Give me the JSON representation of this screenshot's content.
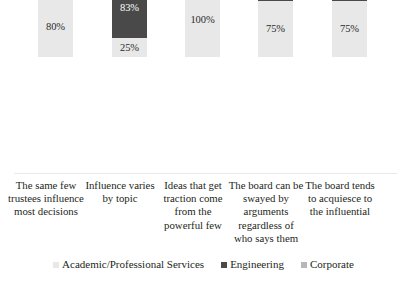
{
  "chart_data": {
    "type": "bar",
    "subtype": "stacked-bar",
    "title": "",
    "subtitle": "",
    "xlabel": "",
    "ylabel": "",
    "grid": false,
    "legend_position": "bottom",
    "axis_visible": false,
    "ylim": [
      0,
      202
    ],
    "categories": [
      "The same few trustees influence most decisions",
      "Influence varies by topic",
      "Ideas that get traction come from the powerful few",
      "The board can be swayed by arguments regardless of who says them",
      "The board tends to acquiesce to the influential"
    ],
    "series": [
      {
        "name": "Academic/Professional Services",
        "color": "#e8e8e8",
        "values": [
          80,
          25,
          100,
          75,
          75
        ],
        "labels": [
          "80%",
          "25%",
          "100%",
          "75%",
          "75%"
        ]
      },
      {
        "name": "Engineering",
        "color": "#494949",
        "values": [
          33,
          83,
          33,
          33,
          17
        ],
        "labels": [
          "33%",
          "83%",
          "33%",
          "33%",
          "17%"
        ]
      },
      {
        "name": "Corporate",
        "color": "#b7b7b7",
        "values": [
          43,
          86,
          29,
          71,
          29
        ],
        "labels": [
          "43%",
          "86%",
          "29%",
          "71%",
          "29%"
        ]
      }
    ]
  },
  "legend": {
    "items": [
      {
        "label": "Academic/Professional Services",
        "color": "#e8e8e8",
        "icon": "square-swatch-icon"
      },
      {
        "label": "Engineering",
        "color": "#494949",
        "icon": "square-swatch-icon"
      },
      {
        "label": "Corporate",
        "color": "#b7b7b7",
        "icon": "square-swatch-icon"
      }
    ]
  },
  "bars": [
    {
      "category": "The same few trustees influence most decisions",
      "x": 38,
      "label_x": 8,
      "segments": [
        {
          "series": "Academic/Professional Services",
          "value": 80,
          "label": "80%",
          "class": "seg-academic"
        },
        {
          "series": "Engineering",
          "value": 33,
          "label": "33%",
          "class": "seg-engineering"
        },
        {
          "series": "Corporate",
          "value": 43,
          "label": "43%",
          "class": "seg-corporate"
        }
      ]
    },
    {
      "category": "Influence varies by topic",
      "x": 112,
      "label_x": 82,
      "segments": [
        {
          "series": "Academic/Professional Services",
          "value": 25,
          "label": "25%",
          "class": "seg-academic"
        },
        {
          "series": "Engineering",
          "value": 83,
          "label": "83%",
          "class": "seg-engineering"
        },
        {
          "series": "Corporate",
          "value": 86,
          "label": "86%",
          "class": "seg-corporate"
        }
      ]
    },
    {
      "category": "Ideas that get traction come from the powerful few",
      "x": 185,
      "label_x": 155,
      "segments": [
        {
          "series": "Academic/Professional Services",
          "value": 100,
          "label": "100%",
          "class": "seg-academic"
        },
        {
          "series": "Engineering",
          "value": 33,
          "label": "33%",
          "class": "seg-engineering"
        },
        {
          "series": "Corporate",
          "value": 29,
          "label": "29%",
          "class": "seg-corporate"
        }
      ]
    },
    {
      "category": "The board can be swayed by arguments regardless of who says them",
      "x": 258,
      "label_x": 228,
      "segments": [
        {
          "series": "Academic/Professional Services",
          "value": 75,
          "label": "75%",
          "class": "seg-academic"
        },
        {
          "series": "Engineering",
          "value": 33,
          "label": "33%",
          "class": "seg-engineering"
        },
        {
          "series": "Corporate",
          "value": 71,
          "label": "71%",
          "class": "seg-corporate"
        }
      ]
    },
    {
      "category": "The board tends to acquiesce to the influential",
      "x": 332,
      "label_x": 302,
      "segments": [
        {
          "series": "Academic/Professional Services",
          "value": 75,
          "label": "75%",
          "class": "seg-academic"
        },
        {
          "series": "Engineering",
          "value": 17,
          "label": "17%",
          "class": "seg-engineering"
        },
        {
          "series": "Corporate",
          "value": 29,
          "label": "29%",
          "class": "seg-corporate"
        }
      ]
    }
  ]
}
